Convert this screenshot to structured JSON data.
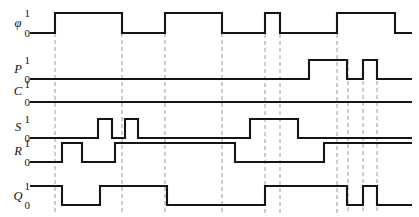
{
  "figure": {
    "kind": "digital-timing-diagram",
    "background_color": "#ffffff",
    "wave_color": "#151515",
    "gridline_color": "#9a9a9a",
    "width": 419,
    "height": 217,
    "time_axis_start": 30,
    "time_axis_end": 412
  },
  "level_labels": {
    "high": "1",
    "low": "0"
  },
  "gridlines": [
    55,
    122,
    165,
    222,
    265,
    280,
    337,
    348,
    363,
    377
  ],
  "chart_data": {
    "type": "line",
    "title": "",
    "xlabel": "",
    "ylabel": "",
    "grid": true,
    "legend_position": "left",
    "x": [
      30,
      55,
      62,
      82,
      98,
      100,
      112,
      122,
      125,
      138,
      165,
      167,
      222,
      235,
      250,
      265,
      280,
      298,
      309,
      324,
      337,
      347,
      363,
      377,
      395,
      412
    ],
    "series": [
      {
        "name": "φ",
        "label": "φ",
        "row": 0,
        "initial": 0,
        "edges": [
          {
            "t": 55,
            "level": 1
          },
          {
            "t": 122,
            "level": 0
          },
          {
            "t": 165,
            "level": 1
          },
          {
            "t": 222,
            "level": 0
          },
          {
            "t": 265,
            "level": 1
          },
          {
            "t": 280,
            "level": 0
          },
          {
            "t": 337,
            "level": 1
          },
          {
            "t": 395,
            "level": 0
          }
        ]
      },
      {
        "name": "P",
        "label": "P",
        "row": 1,
        "initial": 0,
        "edges": [
          {
            "t": 309,
            "level": 1
          },
          {
            "t": 347,
            "level": 0
          },
          {
            "t": 363,
            "level": 1
          },
          {
            "t": 377,
            "level": 0
          }
        ]
      },
      {
        "name": "C",
        "label": "C",
        "row": 2,
        "initial": 0,
        "edges": []
      },
      {
        "name": "S",
        "label": "S",
        "row": 3,
        "initial": 0,
        "edges": [
          {
            "t": 98,
            "level": 1
          },
          {
            "t": 112,
            "level": 0
          },
          {
            "t": 125,
            "level": 1
          },
          {
            "t": 138,
            "level": 0
          },
          {
            "t": 250,
            "level": 1
          },
          {
            "t": 298,
            "level": 0
          }
        ]
      },
      {
        "name": "R",
        "label": "R",
        "row": 4,
        "initial": 0,
        "edges": [
          {
            "t": 62,
            "level": 1
          },
          {
            "t": 82,
            "level": 0
          },
          {
            "t": 115,
            "level": 1
          },
          {
            "t": 235,
            "level": 0
          },
          {
            "t": 324,
            "level": 1
          }
        ]
      },
      {
        "name": "Q",
        "label": "Q",
        "row": 5,
        "initial": 1,
        "edges": [
          {
            "t": 62,
            "level": 0
          },
          {
            "t": 100,
            "level": 1
          },
          {
            "t": 167,
            "level": 0
          },
          {
            "t": 265,
            "level": 1
          },
          {
            "t": 347,
            "level": 0
          },
          {
            "t": 363,
            "level": 1
          },
          {
            "t": 377,
            "level": 0
          }
        ]
      }
    ]
  },
  "rows": [
    {
      "name": "clock-phi",
      "label": "φ",
      "label_x": 18,
      "label_y": 27,
      "y_high": 13,
      "y_low": 33
    },
    {
      "name": "preset-p",
      "label": "P",
      "label_x": 18,
      "label_y": 73,
      "y_high": 60,
      "y_low": 79
    },
    {
      "name": "clear-c",
      "label": "C",
      "label_x": 18,
      "label_y": 95,
      "y_high": 84,
      "y_low": 102
    },
    {
      "name": "set-s",
      "label": "S",
      "label_x": 18,
      "label_y": 131,
      "y_high": 119,
      "y_low": 138
    },
    {
      "name": "reset-r",
      "label": "R",
      "label_x": 18,
      "label_y": 155,
      "y_high": 143,
      "y_low": 162
    },
    {
      "name": "output-q",
      "label": "Q",
      "label_x": 18,
      "label_y": 200,
      "y_high": 186,
      "y_low": 205
    }
  ],
  "gridline_spans": [
    {
      "x": 55,
      "y1": 33,
      "y2": 214
    },
    {
      "x": 122,
      "y1": 33,
      "y2": 214
    },
    {
      "x": 165,
      "y1": 33,
      "y2": 214
    },
    {
      "x": 222,
      "y1": 33,
      "y2": 214
    },
    {
      "x": 265,
      "y1": 13,
      "y2": 214
    },
    {
      "x": 280,
      "y1": 13,
      "y2": 214
    },
    {
      "x": 337,
      "y1": 13,
      "y2": 214
    },
    {
      "x": 348,
      "y1": 60,
      "y2": 214
    },
    {
      "x": 363,
      "y1": 60,
      "y2": 214
    },
    {
      "x": 377,
      "y1": 60,
      "y2": 214
    }
  ]
}
